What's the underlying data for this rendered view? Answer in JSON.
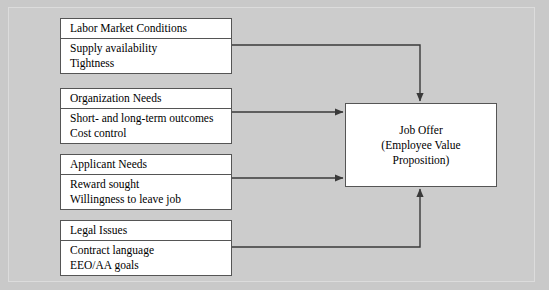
{
  "diagram": {
    "sources": [
      {
        "id": "labor-market-conditions",
        "header": "Labor Market Conditions",
        "lines": [
          "Supply availability",
          "Tightness"
        ]
      },
      {
        "id": "organization-needs",
        "header": "Organization Needs",
        "lines": [
          "Short- and long-term outcomes",
          "Cost control"
        ]
      },
      {
        "id": "applicant-needs",
        "header": "Applicant Needs",
        "lines": [
          "Reward sought",
          "Willingness to leave job"
        ]
      },
      {
        "id": "legal-issues",
        "header": "Legal Issues",
        "lines": [
          "Contract language",
          "EEO/AA goals"
        ]
      }
    ],
    "target": {
      "id": "job-offer",
      "lines": [
        "Job Offer",
        "(Employee Value",
        "Proposition)"
      ]
    },
    "connectors": [
      {
        "from": "labor-market-conditions",
        "to": "job-offer",
        "route": "elbow-top",
        "enters": "top"
      },
      {
        "from": "organization-needs",
        "to": "job-offer",
        "route": "straight",
        "enters": "left"
      },
      {
        "from": "applicant-needs",
        "to": "job-offer",
        "route": "straight",
        "enters": "left"
      },
      {
        "from": "legal-issues",
        "to": "job-offer",
        "route": "elbow-bottom",
        "enters": "bottom"
      }
    ],
    "colors": {
      "background": "#c9c9c9",
      "frame": "#dcdcdc",
      "box_fill": "#ffffff",
      "box_border": "#555555",
      "connector": "#3a3a3a",
      "text": "#000000"
    }
  }
}
